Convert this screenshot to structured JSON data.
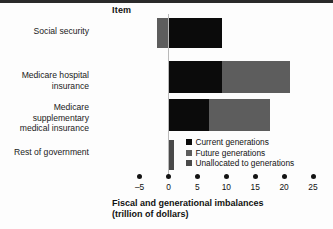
{
  "header": {
    "item_column_label": "Item"
  },
  "chart_data": {
    "type": "bar",
    "orientation": "horizontal",
    "stacked": true,
    "title": "",
    "xlabel": "Fiscal and generational imbalances\n(trillion of dollars)",
    "ylabel": "Item",
    "categories": [
      "Social security",
      "Medicare hospital insurance",
      "Medicare supplementary\nmedical insurance",
      "Rest of government"
    ],
    "series": [
      {
        "name": "Current generations",
        "color": "#0b0b0b",
        "values": [
          9.3,
          9.3,
          7.0,
          0.0
        ]
      },
      {
        "name": "Future generations",
        "color": "#5d5d5d",
        "values": [
          -2.0,
          11.7,
          10.5,
          0.0
        ]
      },
      {
        "name": "Unallocated to generations",
        "color": "#4a4a4a",
        "values": [
          0.0,
          0.0,
          0.0,
          1.0
        ]
      }
    ],
    "xticks": [
      -5,
      0,
      5,
      10,
      15,
      20,
      25
    ],
    "xtick_labels": [
      "–5",
      "0",
      "5",
      "10",
      "15",
      "20",
      "25"
    ],
    "xlim": [
      -5,
      25
    ],
    "grid": false,
    "legend_position": "inside-lower-right",
    "legend": [
      {
        "label": "Current generations",
        "color": "#0b0b0b"
      },
      {
        "label": "Future generations",
        "color": "#5d5d5d"
      },
      {
        "label": "Unallocated to generations",
        "color": "#4a4a4a"
      }
    ]
  },
  "axis": {
    "title": "Fiscal and generational imbalances\n(trillion of dollars)"
  }
}
